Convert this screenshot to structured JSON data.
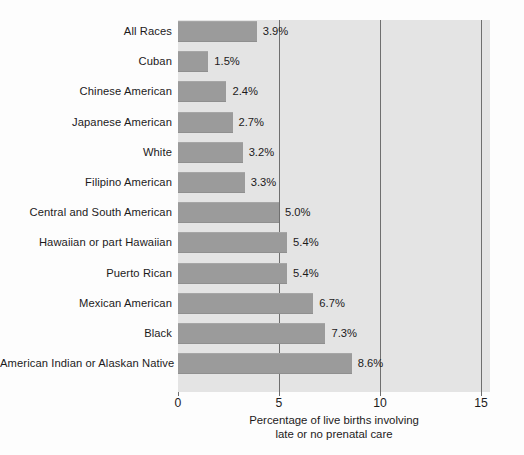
{
  "chart_data": {
    "type": "bar",
    "orientation": "horizontal",
    "title": "",
    "subtitle": "",
    "xlabel_line1": "Percentage of live births involving",
    "xlabel_line2": "late or no prenatal care",
    "ylabel": "",
    "categories": [
      "All Races",
      "Cuban",
      "Chinese American",
      "Japanese American",
      "White",
      "Filipino American",
      "Central and South American",
      "Hawaiian or part Hawaiian",
      "Puerto Rican",
      "Mexican American",
      "Black",
      "American Indian or Alaskan Native"
    ],
    "values": [
      3.9,
      1.5,
      2.4,
      2.7,
      3.2,
      3.3,
      5.0,
      5.4,
      5.4,
      6.7,
      7.3,
      8.6
    ],
    "value_labels": [
      "3.9%",
      "1.5%",
      "2.4%",
      "2.7%",
      "3.2%",
      "3.3%",
      "5.0%",
      "5.4%",
      "5.4%",
      "6.7%",
      "7.3%",
      "8.6%"
    ],
    "xlim": [
      0,
      15
    ],
    "xticks": [
      0,
      5,
      10,
      15
    ],
    "xtick_labels": [
      "0",
      "5",
      "10",
      "15"
    ],
    "gridlines_at": [
      5,
      10,
      15
    ],
    "grid": true,
    "legend": "none",
    "colors": {
      "bar_fill": "#9b9b9b",
      "plot_background": "#e4e4e4",
      "gridline": "#6f6f6f",
      "text": "#1c1a1b",
      "figure_background": "#fdfdfd"
    }
  }
}
